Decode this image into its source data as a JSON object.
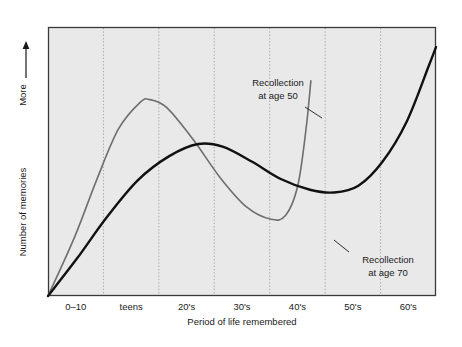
{
  "chart_data": {
    "type": "line",
    "title": "",
    "xlabel": "Period of life remembered",
    "ylabel": "Number of memories",
    "ylabel_arrow_text": "More",
    "ylabel_arrow_icon": "up-arrow-icon",
    "grid": "vertical-dotted",
    "legend_position": "inline-annotations",
    "categories": [
      "0–10",
      "teens",
      "20's",
      "30's",
      "40's",
      "50's",
      "60's"
    ],
    "axis_ranges": {
      "x": [
        0,
        7
      ],
      "y": [
        0,
        1
      ]
    },
    "series": [
      {
        "name": "Recollection at age 50",
        "color": "#6e6e6e",
        "annotation": "Recollection\nat age 50",
        "annotation_line1": "Recollection",
        "annotation_line2": "at age 50",
        "description": "Rises steeply from childhood, peaks in the teens, declines through the 20's and 30's to a trough near the 40's, then rises sharply at the period nearest the person's current age (age 50).",
        "points": [
          {
            "x": 0.0,
            "y": 0.0
          },
          {
            "x": 0.55,
            "y": 0.22
          },
          {
            "x": 1.0,
            "y": 0.43
          },
          {
            "x": 1.45,
            "y": 0.62
          },
          {
            "x": 1.9,
            "y": 0.72
          },
          {
            "x": 2.1,
            "y": 0.73
          },
          {
            "x": 2.45,
            "y": 0.7
          },
          {
            "x": 3.0,
            "y": 0.58
          },
          {
            "x": 3.55,
            "y": 0.44
          },
          {
            "x": 4.1,
            "y": 0.33
          },
          {
            "x": 4.6,
            "y": 0.285
          },
          {
            "x": 4.9,
            "y": 0.3
          },
          {
            "x": 5.15,
            "y": 0.41
          },
          {
            "x": 5.32,
            "y": 0.62
          },
          {
            "x": 5.42,
            "y": 0.8
          }
        ]
      },
      {
        "name": "Recollection at age 70",
        "color": "#111111",
        "annotation": "Recollection\nat age 70",
        "annotation_line1": "Recollection",
        "annotation_line2": "at age 70",
        "description": "Rises steadily from childhood to a broad plateau in the 20's and 30's, dips to a trough in the 50's, then climbs steeply toward the period nearest the person's current age (age 70).",
        "points": [
          {
            "x": 0.0,
            "y": 0.0
          },
          {
            "x": 0.6,
            "y": 0.14
          },
          {
            "x": 1.2,
            "y": 0.29
          },
          {
            "x": 1.85,
            "y": 0.43
          },
          {
            "x": 2.5,
            "y": 0.52
          },
          {
            "x": 3.1,
            "y": 0.565
          },
          {
            "x": 3.6,
            "y": 0.555
          },
          {
            "x": 4.2,
            "y": 0.5
          },
          {
            "x": 4.8,
            "y": 0.435
          },
          {
            "x": 5.4,
            "y": 0.395
          },
          {
            "x": 5.9,
            "y": 0.385
          },
          {
            "x": 6.4,
            "y": 0.41
          },
          {
            "x": 6.9,
            "y": 0.5
          },
          {
            "x": 7.4,
            "y": 0.65
          },
          {
            "x": 7.85,
            "y": 0.855
          },
          {
            "x": 8.0,
            "y": 0.925
          }
        ]
      }
    ]
  },
  "annotations": [
    {
      "name": "recollection-age-50-annotation",
      "line1": "Recollection",
      "line2": "at age 50"
    },
    {
      "name": "recollection-age-70-annotation",
      "line1": "Recollection",
      "line2": "at age 70"
    }
  ],
  "colors": {
    "plot_background": "#e9e9e9",
    "page_background": "#ffffff",
    "frame": "#3a3a3a",
    "gridline": "#a8a8a8",
    "series_age50": "#6e6e6e",
    "series_age70": "#111111",
    "text": "#1a1a1a"
  }
}
